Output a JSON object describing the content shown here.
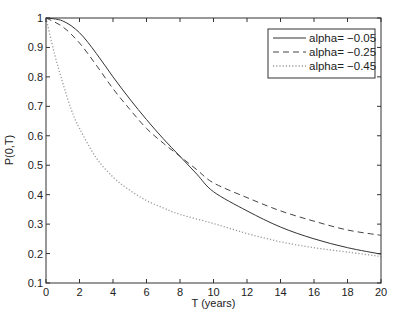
{
  "chart_data": {
    "type": "line",
    "title": "",
    "xlabel": "T (years)",
    "ylabel": "P(0,T)",
    "xlim": [
      0,
      20
    ],
    "ylim": [
      0.1,
      1
    ],
    "xticks": [
      0,
      2,
      4,
      6,
      8,
      10,
      12,
      14,
      16,
      18,
      20
    ],
    "yticks": [
      0.1,
      0.2,
      0.3,
      0.4,
      0.5,
      0.6,
      0.7,
      0.8,
      0.9,
      1
    ],
    "ytick_labels": [
      "0.1",
      "0.2",
      "0.3",
      "0.4",
      "0.5",
      "0.6",
      "0.7",
      "0.8",
      "0.9",
      "1"
    ],
    "grid": false,
    "legend_position": "top-right",
    "series": [
      {
        "name": "alpha= −0.05",
        "style": "solid",
        "color": "#333333",
        "x": [
          0,
          1,
          2,
          3,
          4,
          5,
          6,
          7,
          8,
          9,
          10,
          12,
          14,
          16,
          18,
          20
        ],
        "y": [
          1.0,
          0.99,
          0.95,
          0.88,
          0.8,
          0.725,
          0.655,
          0.59,
          0.53,
          0.47,
          0.41,
          0.345,
          0.29,
          0.25,
          0.22,
          0.198
        ]
      },
      {
        "name": "alpha= −0.25",
        "style": "dashed",
        "color": "#444444",
        "x": [
          0,
          1,
          2,
          3,
          4,
          5,
          6,
          7,
          8,
          9,
          10,
          12,
          14,
          16,
          18,
          20
        ],
        "y": [
          1.0,
          0.97,
          0.915,
          0.84,
          0.76,
          0.69,
          0.625,
          0.575,
          0.53,
          0.485,
          0.44,
          0.39,
          0.345,
          0.31,
          0.28,
          0.262
        ]
      },
      {
        "name": "alpha= −0.45",
        "style": "dotted",
        "color": "#999999",
        "x": [
          0,
          0.5,
          1,
          1.5,
          2,
          3,
          4,
          5,
          6,
          7,
          8,
          10,
          12,
          14,
          16,
          18,
          20
        ],
        "y": [
          1.0,
          0.88,
          0.78,
          0.69,
          0.625,
          0.525,
          0.46,
          0.415,
          0.38,
          0.355,
          0.333,
          0.302,
          0.268,
          0.24,
          0.22,
          0.205,
          0.19
        ]
      }
    ]
  }
}
